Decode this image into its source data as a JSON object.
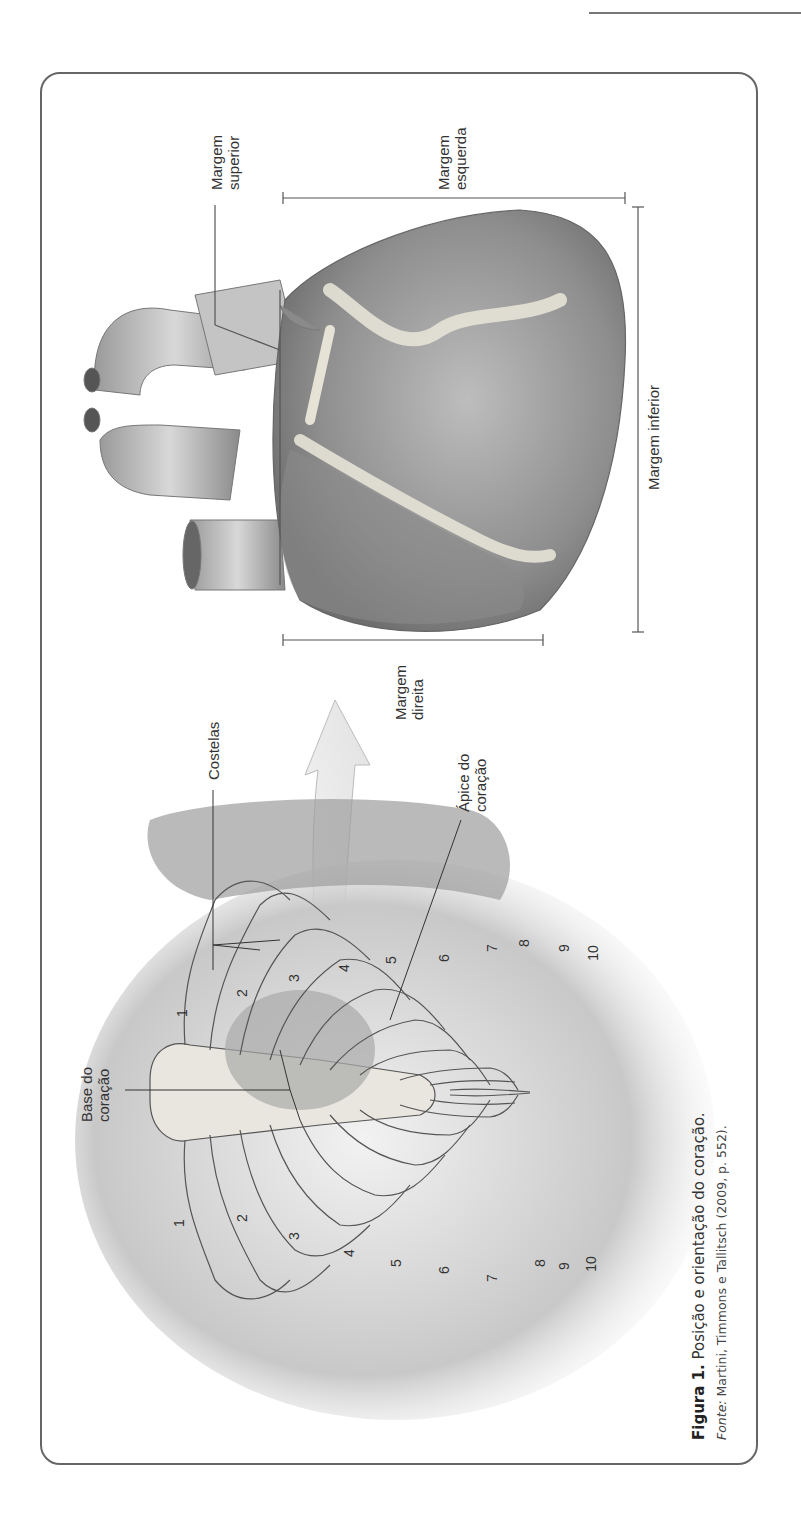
{
  "figure": {
    "number_label": "Figura 1.",
    "title": "Posição e orientação do coração.",
    "source_label": "Fonte:",
    "source_text": "Martini, Timmons e Tallitsch (2009, p. 552)."
  },
  "heart_labels": {
    "margem_superior": [
      "Margem",
      "superior"
    ],
    "margem_esquerda": [
      "Margem",
      "esquerda"
    ],
    "margem_inferior": "Margem inferior",
    "margem_direita": [
      "Margem",
      "direita"
    ]
  },
  "thorax_labels": {
    "costelas": "Costelas",
    "apice": [
      "Ápice do",
      "coração"
    ],
    "base": [
      "Base do",
      "coração"
    ]
  },
  "rib_numbers_left": [
    "1",
    "2",
    "3",
    "4",
    "5",
    "6",
    "7",
    "8",
    "9",
    "10"
  ],
  "rib_numbers_right": [
    "1",
    "2",
    "3",
    "4",
    "5",
    "6",
    "7",
    "8",
    "9",
    "10"
  ],
  "colors": {
    "frame": "#666666",
    "heart_dark": "#7a7a7a",
    "heart_light": "#bdbdbd",
    "fat": "#e6e2d6",
    "rib": "#e8e6de",
    "skin": "#cfcfcf"
  }
}
